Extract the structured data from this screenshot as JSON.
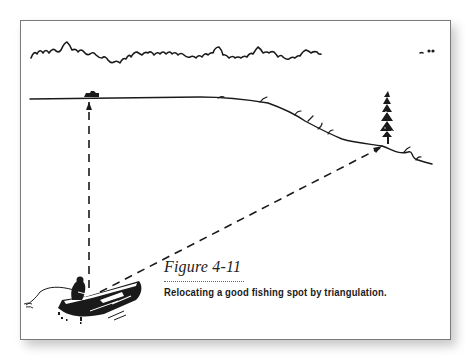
{
  "figure": {
    "label": "Figure 4-11",
    "caption": "Relocating a good fishing spot by triangulation."
  },
  "illustration": {
    "elements": [
      "distant-treeline",
      "far-shoreline",
      "landmark-cabin",
      "landmark-pine-tree",
      "boat-with-angler",
      "sightline-to-cabin",
      "sightline-to-tree"
    ],
    "colors": {
      "ink": "#1a1a1a",
      "frame": "#7a7a7a",
      "background": "#ffffff"
    }
  }
}
